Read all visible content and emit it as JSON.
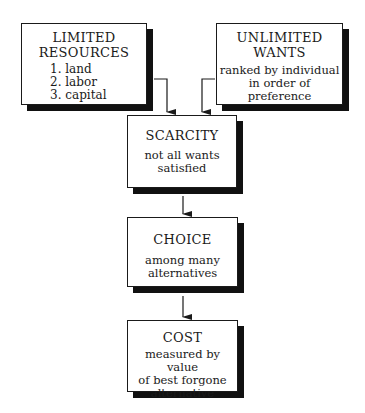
{
  "diagram": {
    "nodes": [
      {
        "id": "limited-resources",
        "title_lines": [
          "LIMITED",
          "RESOURCES"
        ],
        "items": [
          "1.  land",
          "2.  labor",
          "3.  capital"
        ]
      },
      {
        "id": "unlimited-wants",
        "title_lines": [
          "UNLIMITED",
          "WANTS"
        ],
        "subtitle_lines": [
          "ranked by individual",
          "in order of",
          "preference"
        ]
      },
      {
        "id": "scarcity",
        "title": "SCARCITY",
        "subtitle_lines": [
          "not all wants",
          "satisfied"
        ]
      },
      {
        "id": "choice",
        "title": "CHOICE",
        "subtitle_lines": [
          "among many",
          "alternatives"
        ]
      },
      {
        "id": "cost",
        "title": "COST",
        "subtitle_lines": [
          "measured by value",
          "of best forgone",
          "alternative"
        ]
      }
    ],
    "edges": [
      {
        "from": "limited-resources",
        "to": "scarcity"
      },
      {
        "from": "unlimited-wants",
        "to": "scarcity"
      },
      {
        "from": "scarcity",
        "to": "choice"
      },
      {
        "from": "choice",
        "to": "cost"
      }
    ],
    "colors": {
      "border": "#1a1a1a",
      "shadow": "#111111",
      "background": "#ffffff"
    }
  }
}
